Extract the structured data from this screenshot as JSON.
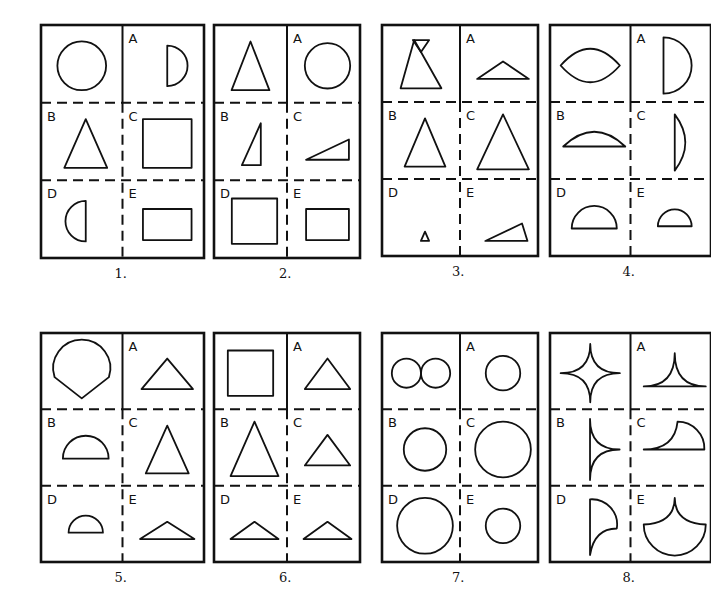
{
  "colors": {
    "ink": "#111111",
    "paper": "#ffffff"
  },
  "cell_labels": [
    "A",
    "B",
    "C",
    "D",
    "E"
  ],
  "puzzles": [
    {
      "number": "1.",
      "box": [
        41,
        25,
        204,
        258
      ],
      "target": "circle",
      "options": {
        "A": "right-half-circle",
        "B": "triangle",
        "C": "square",
        "D": "left-half-circle",
        "E": "rectangle"
      }
    },
    {
      "number": "2.",
      "box": [
        214,
        25,
        360,
        258
      ],
      "target": "triangle",
      "options": {
        "A": "circle",
        "B": "right-triangle-tall",
        "C": "right-triangle-wide",
        "D": "square",
        "E": "rectangle"
      }
    },
    {
      "number": "3.",
      "box": [
        382,
        25,
        538,
        256
      ],
      "target": "hourglass-triangles",
      "options": {
        "A": "flat-triangle",
        "B": "triangle",
        "C": "large-triangle",
        "D": "small-triangle",
        "E": "scalene-triangle"
      }
    },
    {
      "number": "4.",
      "box": [
        550,
        25,
        711,
        256
      ],
      "target": "lens",
      "options": {
        "A": "right-half-circle-large",
        "B": "circle-segment",
        "C": "thin-segment-vertical",
        "D": "half-circle",
        "E": "half-circle-small"
      }
    },
    {
      "number": "5.",
      "box": [
        41,
        333,
        204,
        562
      ],
      "target": "fan-sector",
      "options": {
        "A": "wide-triangle",
        "B": "half-circle",
        "C": "triangle",
        "D": "half-circle-small",
        "E": "flat-triangle"
      }
    },
    {
      "number": "6.",
      "box": [
        214,
        333,
        360,
        562
      ],
      "target": "square",
      "options": {
        "A": "wide-triangle",
        "B": "large-triangle",
        "C": "wide-triangle",
        "D": "flat-triangle",
        "E": "flat-triangle"
      }
    },
    {
      "number": "7.",
      "box": [
        382,
        333,
        538,
        562
      ],
      "target": "two-circles",
      "options": {
        "A": "circle-small",
        "B": "circle-medium",
        "C": "circle-large",
        "D": "circle-large",
        "E": "circle-small"
      }
    },
    {
      "number": "8.",
      "box": [
        550,
        333,
        711,
        562
      ],
      "target": "four-point-star",
      "options": {
        "A": "cusp-triangle",
        "B": "half-star-vertical",
        "C": "quarter-fan",
        "D": "concave-quarter",
        "E": "cusp-bowl"
      }
    }
  ]
}
